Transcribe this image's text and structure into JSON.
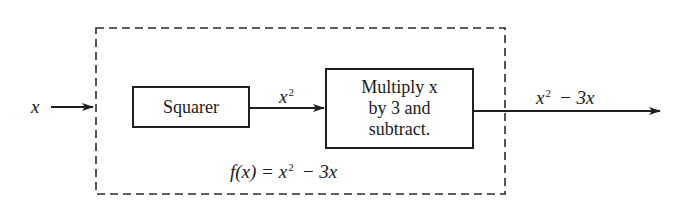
{
  "diagram": {
    "input_label": "x",
    "frame_style": "dashed",
    "blocks": [
      {
        "id": "squarer",
        "label": "Squarer"
      },
      {
        "id": "multiply",
        "lines": [
          "Multiply x",
          "by 3 and",
          "subtract."
        ]
      }
    ],
    "edges": [
      {
        "from": "input",
        "to": "squarer",
        "label": "x"
      },
      {
        "from": "squarer",
        "to": "multiply",
        "label_base": "x",
        "label_exp": "2"
      },
      {
        "from": "multiply",
        "to": "output",
        "label_base": "x",
        "label_exp": "2",
        "label_rest": "− 3x"
      }
    ],
    "function_label": {
      "prefix": "f(x) = x",
      "exp": "2",
      "rest": "− 3x"
    },
    "colors": {
      "stroke": "#1f1f1f",
      "background": "#ffffff"
    }
  }
}
